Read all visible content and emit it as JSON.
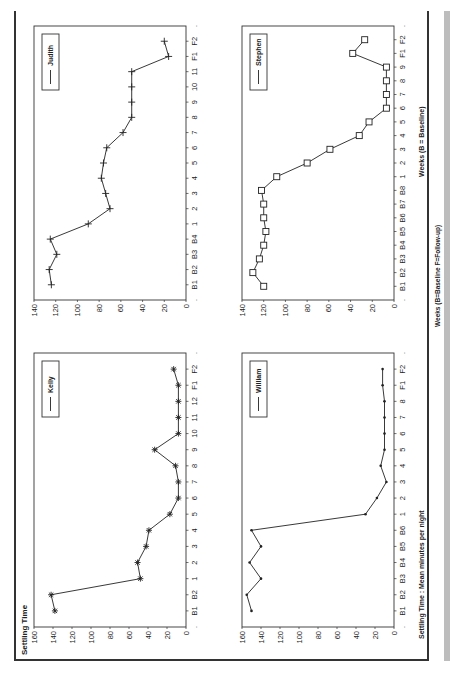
{
  "page": {
    "title": "Settling Time",
    "y_axis_caption": "Settling Time : Mean minutes per night",
    "x_axis_caption_main": "Weeks  (B = Baseline)",
    "x_axis_caption_footer": "Weeks  (B=Baseline  F=Follow-up)"
  },
  "chart_data": [
    {
      "type": "line",
      "title": "Settling Time",
      "series": [
        {
          "name": "Kelly",
          "marker": "star",
          "values": [
            138,
            142,
            48,
            51,
            42,
            39,
            17,
            8,
            8,
            11,
            33,
            8,
            8,
            8,
            8,
            13
          ]
        }
      ],
      "categories": [
        "B1",
        "B2",
        "1",
        "2",
        "3",
        "4",
        "5",
        "6",
        "7",
        "8",
        "9",
        "10",
        "11",
        "12",
        "F1",
        "F2"
      ],
      "xlabel": "",
      "ylabel": "",
      "ylim": [
        0,
        160
      ],
      "yticks": [
        0,
        20,
        40,
        60,
        80,
        100,
        120,
        140,
        160
      ],
      "grid": false,
      "legend_position": "top-right"
    },
    {
      "type": "line",
      "title": "",
      "series": [
        {
          "name": "William",
          "marker": "dot",
          "values": [
            150,
            155,
            140,
            152,
            140,
            150,
            30,
            18,
            8,
            14,
            10,
            10,
            10,
            10,
            12,
            12
          ]
        }
      ],
      "categories": [
        "B1",
        "B2",
        "B3",
        "B4",
        "B5",
        "B6",
        "1",
        "2",
        "3",
        "4",
        "5",
        "6",
        "7",
        "8",
        "F1",
        "F2"
      ],
      "xlabel": "",
      "ylabel": "Settling Time : Mean minutes per night",
      "ylim": [
        0,
        160
      ],
      "yticks": [
        0,
        20,
        40,
        60,
        80,
        100,
        120,
        140,
        160
      ],
      "grid": false,
      "legend_position": "top-right"
    },
    {
      "type": "line",
      "title": "",
      "series": [
        {
          "name": "Judith",
          "marker": "plus",
          "values": [
            124,
            126,
            119,
            125,
            90,
            70,
            74,
            78,
            76,
            73,
            58,
            50,
            50,
            50,
            50,
            16,
            20
          ]
        }
      ],
      "categories": [
        "B1",
        "B2",
        "B3",
        "B4",
        "1",
        "2",
        "3",
        "4",
        "5",
        "6",
        "7",
        "8",
        "9",
        "10",
        "11",
        "F1",
        "F2"
      ],
      "xlabel": "",
      "ylabel": "",
      "ylim": [
        0,
        140
      ],
      "yticks": [
        0,
        20,
        40,
        60,
        80,
        100,
        120,
        140
      ],
      "grid": false,
      "legend_position": "top-right"
    },
    {
      "type": "line",
      "title": "",
      "series": [
        {
          "name": "Stephen",
          "marker": "square",
          "values": [
            120,
            130,
            124,
            120,
            118,
            120,
            120,
            122,
            108,
            80,
            59,
            32,
            23,
            7,
            7,
            7,
            7,
            38,
            27
          ]
        }
      ],
      "categories": [
        "B1",
        "B2",
        "B3",
        "B4",
        "B5",
        "B6",
        "B7",
        "B8",
        "1",
        "2",
        "3",
        "4",
        "5",
        "6",
        "7",
        "8",
        "9",
        "F1",
        "F2"
      ],
      "xlabel": "Weeks  (B = Baseline)",
      "ylabel": "",
      "ylim": [
        0,
        140
      ],
      "yticks": [
        0,
        20,
        40,
        60,
        80,
        100,
        120,
        140
      ],
      "grid": false,
      "legend_position": "top-right"
    }
  ]
}
